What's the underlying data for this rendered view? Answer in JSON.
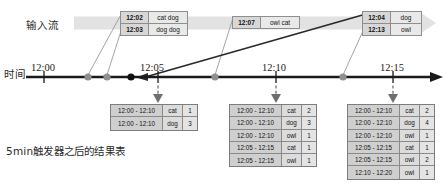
{
  "labels": {
    "input_stream": "输入流",
    "time_axis": "时间",
    "caption": "5min触发器之后的结果表"
  },
  "colors": {
    "band": "#e2e2e2",
    "axis": "#1a1a1a",
    "dot_gray": "#8f8f8f",
    "dot_black": "#111111",
    "box_border": "#8e8e8e",
    "box_header": "#d7d7d7",
    "box_value": "#e9e9e9",
    "table_border": "#7d7d7d",
    "leader": "#9a9a9a"
  },
  "axis": {
    "ticks": [
      {
        "label": "12:00",
        "x": 31
      },
      {
        "label": "12:05",
        "x": 140
      },
      {
        "label": "12:10",
        "x": 275
      },
      {
        "label": "12:15",
        "x": 384
      }
    ]
  },
  "event_boxes": [
    {
      "name": "event-box-1",
      "rows": [
        {
          "time": "12:02",
          "value": "cat dog"
        },
        {
          "time": "12:03",
          "value": "dog dog"
        }
      ]
    },
    {
      "name": "event-box-2",
      "rows": [
        {
          "time": "12:07",
          "value": "owl cat"
        }
      ]
    },
    {
      "name": "event-box-3",
      "rows": [
        {
          "time": "12:04",
          "value": "dog"
        },
        {
          "time": "12:13",
          "value": "owl"
        }
      ]
    }
  ],
  "result_tables": [
    {
      "name": "result-table-1205",
      "rows": [
        {
          "window": "12:00 - 12:10",
          "key": "cat",
          "count": "1"
        },
        {
          "window": "12:00 - 12:10",
          "key": "dog",
          "count": "3"
        }
      ]
    },
    {
      "name": "result-table-1210",
      "rows": [
        {
          "window": "12:00 - 12:10",
          "key": "cat",
          "count": "2"
        },
        {
          "window": "12:00 - 12:10",
          "key": "dog",
          "count": "3"
        },
        {
          "window": "12:00 - 12:10",
          "key": "owl",
          "count": "1"
        },
        {
          "window": "12:05 - 12:15",
          "key": "cat",
          "count": "1"
        },
        {
          "window": "12:05 - 12:15",
          "key": "owl",
          "count": "1"
        }
      ]
    },
    {
      "name": "result-table-1215",
      "rows": [
        {
          "window": "12:00 - 12:10",
          "key": "cat",
          "count": "2"
        },
        {
          "window": "12:00 - 12:10",
          "key": "dog",
          "count": "4"
        },
        {
          "window": "12:00 - 12:10",
          "key": "owl",
          "count": "1"
        },
        {
          "window": "12:05 - 12:15",
          "key": "cat",
          "count": "1"
        },
        {
          "window": "12:05 - 12:15",
          "key": "owl",
          "count": "2"
        },
        {
          "window": "12:10 - 12:20",
          "key": "owl",
          "count": "1"
        }
      ]
    }
  ]
}
